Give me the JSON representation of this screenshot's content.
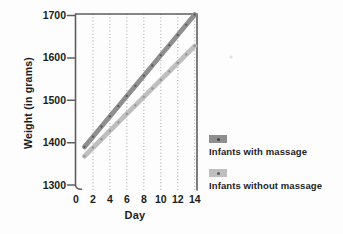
{
  "figure": {
    "background": "#fdfdfd",
    "text_color": "#1c1c1c"
  },
  "chart_data": {
    "type": "line",
    "title": "",
    "xlabel": "Day",
    "ylabel": "Weight (in grams)",
    "x_ticks": [
      0,
      2,
      4,
      6,
      8,
      10,
      12,
      14
    ],
    "y_ticks": [
      1700,
      1600,
      1500,
      1400,
      1300
    ],
    "xlim": [
      0,
      14.3
    ],
    "ylim": [
      1300,
      1700
    ],
    "grid": "vertical dotted gridlines at even days",
    "legend_position": "right of plot",
    "x": [
      1,
      2,
      3,
      4,
      5,
      6,
      7,
      8,
      9,
      10,
      11,
      12,
      13,
      14
    ],
    "series": [
      {
        "name": "Infants with massage",
        "color": "#8f8f8f",
        "marker_color": "#525252",
        "values": [
          1390,
          1414,
          1438,
          1462,
          1486,
          1510,
          1534,
          1558,
          1582,
          1606,
          1630,
          1654,
          1678,
          1702
        ]
      },
      {
        "name": "Infants without massage",
        "color": "#bfbfbf",
        "marker_color": "#8c8c8c",
        "values": [
          1368,
          1388,
          1408,
          1428,
          1448,
          1468,
          1488,
          1508,
          1528,
          1548,
          1568,
          1588,
          1608,
          1628
        ]
      }
    ],
    "axis_color": "#5e5e5e",
    "gridline_color": "#9a9a9a"
  }
}
